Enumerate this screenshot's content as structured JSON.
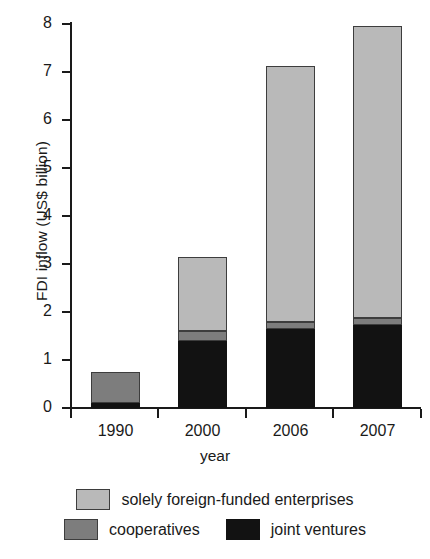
{
  "chart_data": {
    "type": "bar",
    "stacked": true,
    "title": "",
    "xlabel": "year",
    "ylabel": "FDI inflow (US$ billion)",
    "categories": [
      "1990",
      "2000",
      "2006",
      "2007"
    ],
    "ylim": [
      0,
      8
    ],
    "yticks": [
      0,
      1,
      2,
      3,
      4,
      5,
      6,
      7,
      8
    ],
    "ytick_labels": [
      "0",
      "1",
      "2",
      "3",
      "4",
      "5",
      "6",
      "7",
      "8"
    ],
    "grid": false,
    "legend_position": "bottom",
    "series": [
      {
        "name": "joint ventures",
        "color": "#121212",
        "values": [
          0.1,
          1.4,
          1.65,
          1.72
        ]
      },
      {
        "name": "cooperatives",
        "color": "#7d7d7d",
        "values": [
          0.65,
          0.2,
          0.15,
          0.16
        ]
      },
      {
        "name": "solely foreign-funded enterprises",
        "color": "#b9b9b9",
        "values": [
          0.0,
          1.55,
          5.32,
          6.07
        ]
      }
    ],
    "totals": [
      0.75,
      3.15,
      7.12,
      7.95
    ]
  },
  "legend": {
    "entries": [
      {
        "label": "solely foreign-funded enterprises",
        "swatch": "sff"
      },
      {
        "label": "cooperatives",
        "swatch": "coop"
      },
      {
        "label": "joint ventures",
        "swatch": "jv"
      }
    ]
  },
  "axes": {
    "y_title": "FDI inflow (US$ billion)",
    "x_title": "year"
  }
}
